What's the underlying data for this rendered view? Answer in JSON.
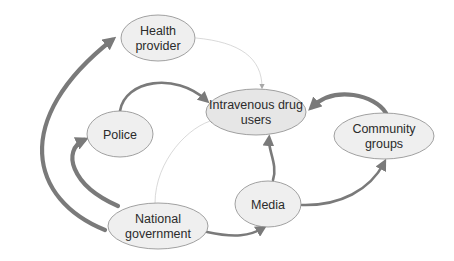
{
  "diagram": {
    "type": "directed-network",
    "nodes": [
      {
        "id": "health",
        "label_lines": [
          "Health",
          "provider"
        ]
      },
      {
        "id": "idu",
        "label_lines": [
          "Intravenous drug",
          "users"
        ],
        "central": true
      },
      {
        "id": "police",
        "label_lines": [
          "Police"
        ]
      },
      {
        "id": "community",
        "label_lines": [
          "Community",
          "groups"
        ]
      },
      {
        "id": "media",
        "label_lines": [
          "Media"
        ]
      },
      {
        "id": "government",
        "label_lines": [
          "National",
          "government"
        ]
      }
    ],
    "edges": [
      {
        "from": "government",
        "to": "health",
        "strength": "strong"
      },
      {
        "from": "government",
        "to": "police",
        "strength": "strong"
      },
      {
        "from": "government",
        "to": "idu",
        "strength": "weak"
      },
      {
        "from": "government",
        "to": "media",
        "strength": "medium"
      },
      {
        "from": "health",
        "to": "idu",
        "strength": "weak"
      },
      {
        "from": "police",
        "to": "idu",
        "strength": "medium"
      },
      {
        "from": "media",
        "to": "idu",
        "strength": "medium"
      },
      {
        "from": "media",
        "to": "community",
        "strength": "medium"
      },
      {
        "from": "community",
        "to": "idu",
        "strength": "strong"
      }
    ]
  }
}
